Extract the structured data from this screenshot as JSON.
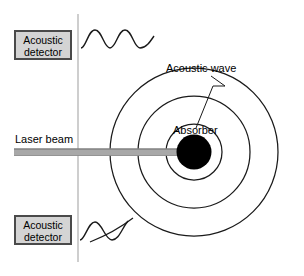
{
  "figure": {
    "width": 304,
    "height": 276,
    "background": "#ffffff"
  },
  "labels": {
    "detector_top": {
      "line1": "Acoustic",
      "line2": "detector"
    },
    "detector_bottom": {
      "line1": "Acoustic",
      "line2": "detector"
    },
    "laser_beam": "Laser beam",
    "acoustic_wave": "Acoustic wave",
    "absorber": "Absorber"
  },
  "colors": {
    "stroke": "#1a1a1a",
    "absorber_fill": "#000000",
    "detector_fill": "#d4d4d4",
    "detector_border": "#4a4a4a",
    "beam_fill": "#a8a8a8",
    "beam_edge": "#7d7d7d",
    "vertical_line": "#b4b4b4",
    "background": "#ffffff"
  },
  "geometry": {
    "center_x": 194,
    "center_y": 152,
    "absorber_radius": 17,
    "wave_radii": [
      28,
      56,
      84
    ],
    "vertical_line_x": 78,
    "vertical_line_top": 14,
    "vertical_line_bottom": 262,
    "beam_x_start": 14,
    "beam_x_end": 194,
    "beam_y": 152,
    "beam_thickness": 7
  }
}
